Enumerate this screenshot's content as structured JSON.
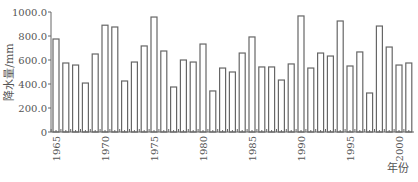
{
  "chart_data": {
    "type": "bar",
    "title": "",
    "xlabel": "年份",
    "ylabel": "降水量/mm",
    "ylim": [
      0,
      1000
    ],
    "yticks": [
      "0",
      "200.0",
      "400.0",
      "600.0",
      "800.0",
      "1000.0"
    ],
    "xtick_labels": [
      "1965",
      "1970",
      "1975",
      "1980",
      "1985",
      "1990",
      "1995",
      "2000"
    ],
    "grid": false,
    "legend": null,
    "categories": [
      "1965",
      "1966",
      "1967",
      "1968",
      "1969",
      "1970",
      "1971",
      "1972",
      "1973",
      "1974",
      "1975",
      "1976",
      "1977",
      "1978",
      "1979",
      "1980",
      "1981",
      "1982",
      "1983",
      "1984",
      "1985",
      "1986",
      "1987",
      "1988",
      "1989",
      "1990",
      "1991",
      "1992",
      "1993",
      "1994",
      "1995",
      "1996",
      "1997",
      "1998",
      "1999",
      "2000",
      "2001"
    ],
    "values": [
      775,
      575,
      558,
      408,
      650,
      890,
      875,
      425,
      583,
      717,
      958,
      675,
      375,
      600,
      583,
      733,
      342,
      533,
      500,
      658,
      792,
      542,
      542,
      433,
      567,
      967,
      533,
      658,
      633,
      925,
      550,
      667,
      325,
      883,
      708,
      558,
      575
    ]
  }
}
